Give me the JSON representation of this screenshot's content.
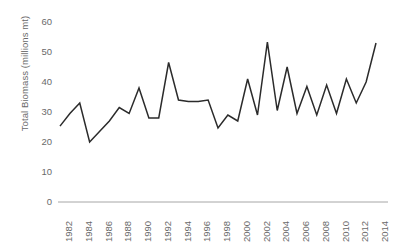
{
  "chart_data": {
    "type": "line",
    "title": "",
    "xlabel": "",
    "ylabel": "Total Biomass (millions mt)",
    "ylim": [
      0,
      60
    ],
    "yticks": [
      0,
      10,
      20,
      30,
      40,
      50,
      60
    ],
    "xlim": [
      1982,
      2014
    ],
    "xticks": [
      1982,
      1984,
      1986,
      1988,
      1990,
      1992,
      1994,
      1996,
      1998,
      2000,
      2002,
      2004,
      2006,
      2008,
      2010,
      2012,
      2014
    ],
    "xtick_labels": [
      "1982",
      "1984",
      "1986",
      "1988",
      "1990",
      "1992",
      "1994",
      "1996",
      "1998",
      "2000",
      "2002",
      "2004",
      "2006",
      "2008",
      "2010",
      "2012",
      "2014"
    ],
    "grid": false,
    "legend": false,
    "line_color": "#2b2b2b",
    "axis_color": "#a6a6a6",
    "text_color": "#6a6a6a",
    "x": [
      1982,
      1983,
      1984,
      1985,
      1986,
      1987,
      1988,
      1989,
      1990,
      1991,
      1992,
      1993,
      1994,
      1995,
      1996,
      1997,
      1998,
      1999,
      2000,
      2001,
      2002,
      2003,
      2004,
      2005,
      2006,
      2007,
      2008,
      2009,
      2010,
      2011,
      2012,
      2013,
      2014
    ],
    "values": [
      25.3,
      29.5,
      33.0,
      20.0,
      23.5,
      27.0,
      31.5,
      29.5,
      38.0,
      28.0,
      28.0,
      46.5,
      34.0,
      33.5,
      33.5,
      34.0,
      24.7,
      29.0,
      27.0,
      41.0,
      29.0,
      53.3,
      30.5,
      45.0,
      29.5,
      38.5,
      29.0,
      39.0,
      29.5,
      41.0,
      33.0,
      40.0,
      53.0
    ],
    "series": [
      {
        "name": "Total Biomass",
        "values": [
          25.3,
          29.5,
          33.0,
          20.0,
          23.5,
          27.0,
          31.5,
          29.5,
          38.0,
          28.0,
          28.0,
          46.5,
          34.0,
          33.5,
          33.5,
          34.0,
          24.7,
          29.0,
          27.0,
          41.0,
          29.0,
          53.3,
          30.5,
          45.0,
          29.5,
          38.5,
          29.0,
          39.0,
          29.5,
          41.0,
          33.0,
          40.0,
          53.0
        ]
      }
    ]
  }
}
